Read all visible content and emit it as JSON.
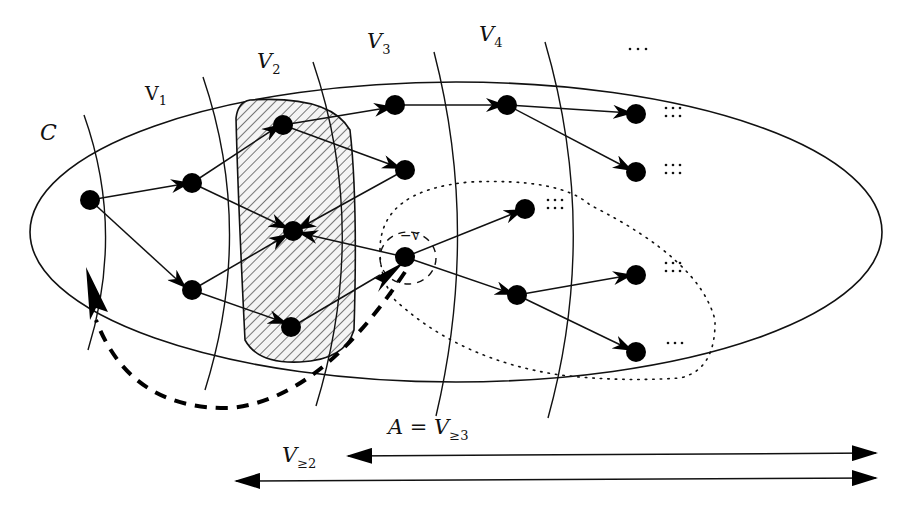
{
  "diagram": {
    "labels": {
      "C": "C",
      "V1": "V",
      "V1_sub": "1",
      "V2": "V",
      "V2_sub": "2",
      "V3": "V",
      "V3_sub": "3",
      "V4": "V",
      "V4_sub": "4",
      "ellipsis_top": "…",
      "v": "v",
      "A_eq": "A = V",
      "A_sub": "≥3",
      "Vge2": "V",
      "Vge2_sub": "≥2"
    },
    "ellipsis_rows": [
      ":::",
      ":::",
      ":::",
      ":::",
      ":::",
      "…"
    ],
    "colors": {
      "stroke": "#111111",
      "node": "#000000",
      "hatch_fill": "#cfcfcf",
      "background": "#ffffff"
    }
  }
}
